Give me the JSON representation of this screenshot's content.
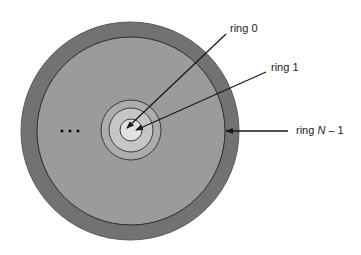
{
  "diagram": {
    "type": "concentric-rings",
    "ellipsis": "...",
    "rings": [
      {
        "name": "ring 0",
        "cx": 131,
        "cy": 130,
        "r": 11,
        "fill": "#e2e2e2"
      },
      {
        "name": "ring 1",
        "cx": 131,
        "cy": 130,
        "r": 22,
        "fill": "#c6c6c6"
      },
      {
        "name": "ring 2",
        "cx": 131,
        "cy": 130,
        "r": 30,
        "fill": "#adadad"
      },
      {
        "name": "middle rings",
        "cx": 131,
        "cy": 131,
        "r": 94,
        "fill": "#9b9b9b"
      },
      {
        "name": "ring N - 1",
        "cx": 130,
        "cy": 131,
        "r": 109,
        "fill": "#727272"
      }
    ],
    "labels": {
      "ring0": "ring 0",
      "ring1": "ring 1",
      "ringN_prefix": "ring ",
      "ringN_var": "N",
      "ringN_suffix": " – 1"
    },
    "colors": {
      "stroke": "#2a2a2a",
      "arrow": "#1a1a1a",
      "text": "#222222"
    }
  }
}
